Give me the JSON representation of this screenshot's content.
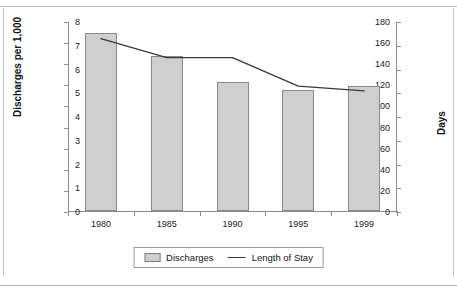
{
  "figure": {
    "top_remnant_text": "",
    "frame_color": "#c3c3c3"
  },
  "chart_data": {
    "type": "bar",
    "title": "",
    "subtitle": "",
    "xlabel": "",
    "ylabel": "Discharges per 1,000",
    "y2label": "Days",
    "categories": [
      "1980",
      "1985",
      "1990",
      "1995",
      "1999"
    ],
    "series": [
      {
        "name": "Discharges",
        "type": "bar",
        "axis": "left",
        "color": "#cfcfcf",
        "border_color": "#8a8a8a",
        "values": [
          169,
          147,
          122,
          115,
          118
        ]
      },
      {
        "name": "Length of Stay",
        "type": "line",
        "axis": "right",
        "color": "#3a3a3a",
        "values": [
          7.3,
          6.5,
          6.5,
          5.3,
          5.1
        ]
      }
    ],
    "ylim": [
      0,
      180
    ],
    "yticks": [
      0,
      20,
      40,
      60,
      80,
      100,
      120,
      140,
      160,
      180
    ],
    "y2lim": [
      0,
      8
    ],
    "y2ticks": [
      0,
      1,
      2,
      3,
      4,
      5,
      6,
      7,
      8
    ],
    "grid": false,
    "legend_position": "bottom-center",
    "legend_entries": [
      "Discharges",
      "Length of Stay"
    ]
  }
}
